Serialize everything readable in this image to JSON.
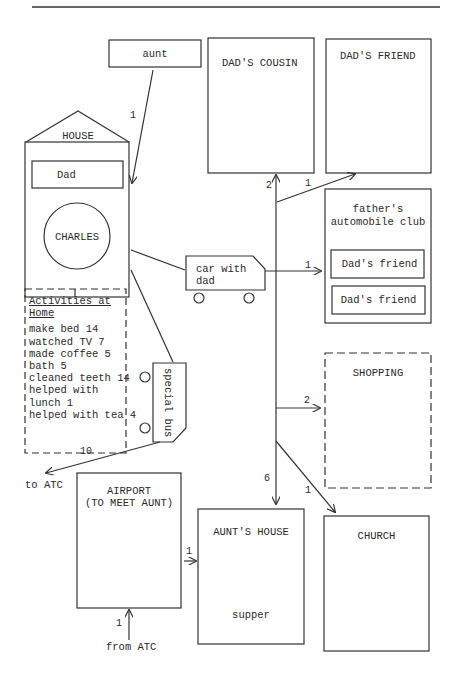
{
  "diagram": {
    "places": {
      "aunt": "aunt",
      "house": "HOUSE",
      "dad": "Dad",
      "charles": "CHARLES",
      "dads_cousin": "DAD'S COUSIN",
      "dads_friend": "DAD'S FRIEND",
      "auto_club_line1": "father's",
      "auto_club_line2": "automobile club",
      "club_friend_1": "Dad's friend",
      "club_friend_2": "Dad's friend",
      "shopping": "SHOPPING",
      "church": "CHURCH",
      "airport_line1": "AIRPORT",
      "airport_line2": "(TO MEET AUNT)",
      "aunts_house": "AUNT'S HOUSE",
      "supper": "supper"
    },
    "vehicles": {
      "car_line1": "car with",
      "car_line2": "dad",
      "bus": "special bus"
    },
    "activities": {
      "title_line1": "Activities at",
      "title_line2": "Home",
      "items": [
        "make bed 14",
        "watched TV 7",
        "made coffee 5",
        "bath 5",
        "cleaned teeth 14",
        "helped with",
        "lunch 1",
        "helped with tea 4"
      ]
    },
    "edges": [
      {
        "from": "aunt",
        "to": "house",
        "count": "1"
      },
      {
        "from": "trunk",
        "to": "dads_cousin",
        "count": "2"
      },
      {
        "from": "trunk",
        "to": "dads_friend",
        "count": "1"
      },
      {
        "from": "car",
        "to": "auto_club",
        "count": "1"
      },
      {
        "from": "trunk",
        "to": "shopping",
        "count": "2"
      },
      {
        "from": "trunk",
        "to": "aunts_house",
        "count": "6"
      },
      {
        "from": "trunk",
        "to": "church",
        "count": "1"
      },
      {
        "from": "bus",
        "to": "atc",
        "count": "10"
      },
      {
        "from": "atc",
        "to": "airport",
        "count": "1"
      },
      {
        "from": "airport",
        "to": "aunts_house",
        "count": "1"
      }
    ],
    "labels": {
      "to_atc": "to ATC",
      "from_atc": "from ATC"
    }
  }
}
